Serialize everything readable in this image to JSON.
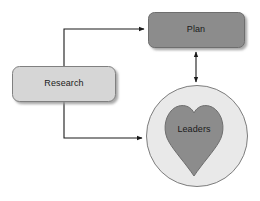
{
  "diagram": {
    "type": "flow-diagram",
    "background_color": "#ffffff",
    "nodes": [
      {
        "id": "research",
        "label": "Research",
        "shape": "rounded-rectangle",
        "fill": "#d6d6d6",
        "stroke": "#808080",
        "x": 12,
        "y": 66,
        "width": 104,
        "height": 36,
        "label_x": 64,
        "label_y": 84
      },
      {
        "id": "plan",
        "label": "Plan",
        "shape": "rounded-rectangle",
        "fill": "#8c8c8c",
        "stroke": "#6e6e6e",
        "x": 148,
        "y": 12,
        "width": 97,
        "height": 36,
        "label_x": 196,
        "label_y": 30
      },
      {
        "id": "leaders-circle",
        "label": "",
        "shape": "circle",
        "fill": "#e9e9e9",
        "stroke": "#7d7d7d",
        "cx": 197,
        "cy": 136,
        "r": 51
      },
      {
        "id": "leaders",
        "label": "Leaders",
        "shape": "heart",
        "fill": "#8c8c8c",
        "stroke": "#6e6e6e",
        "label_x": 194,
        "label_y": 130
      }
    ],
    "connectors": [
      {
        "id": "research-to-plan",
        "from": "research",
        "to": "plan",
        "style": "elbow",
        "arrowheads": "end",
        "color": "#1a1a1a",
        "path": "M 64 66 L 64 29 L 145 29"
      },
      {
        "id": "research-to-leaders",
        "from": "research",
        "to": "leaders-circle",
        "style": "elbow",
        "arrowheads": "end",
        "color": "#1a1a1a",
        "path": "M 64 102 L 64 138 L 143 138"
      },
      {
        "id": "plan-to-leaders",
        "from": "plan",
        "to": "leaders-circle",
        "style": "straight-vertical",
        "arrowheads": "both",
        "color": "#1a1a1a",
        "path": "M 196 51 L 196 82"
      }
    ]
  }
}
